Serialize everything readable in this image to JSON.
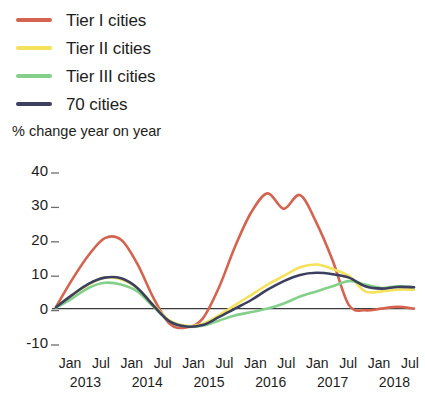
{
  "legend": {
    "items": [
      {
        "label": "Tier I cities",
        "color": "#d4634f",
        "icon": "line-swatch-icon"
      },
      {
        "label": "Tier II cities",
        "color": "#f5e25a",
        "icon": "line-swatch-icon"
      },
      {
        "label": "Tier III cities",
        "color": "#84d08a",
        "icon": "line-swatch-icon"
      },
      {
        "label": "70 cities",
        "color": "#3c3f5e",
        "icon": "line-swatch-icon"
      }
    ]
  },
  "axis_title": "% change year on year",
  "chart_data": {
    "type": "line",
    "title": "",
    "subtitle": "",
    "xlabel": "",
    "ylabel": "% change year on year",
    "ylim": [
      -10,
      40
    ],
    "yticks": [
      40,
      30,
      20,
      10,
      0,
      -10
    ],
    "ytick_labels": [
      "40",
      "30",
      "20",
      "10",
      "0",
      "-10"
    ],
    "grid": false,
    "zero_line": true,
    "legend_position": "top-left",
    "x_tick_labels": [
      "Jan",
      "Jul",
      "Jan",
      "Jul",
      "Jan",
      "Jul",
      "Jan",
      "Jul",
      "Jan",
      "Jul",
      "Jan",
      "Jul"
    ],
    "x_year_labels": [
      "2013",
      "2014",
      "2015",
      "2016",
      "2017",
      "2018"
    ],
    "x": [
      "2013-01",
      "2013-04",
      "2013-07",
      "2013-10",
      "2014-01",
      "2014-04",
      "2014-07",
      "2014-10",
      "2015-01",
      "2015-04",
      "2015-07",
      "2015-10",
      "2016-01",
      "2016-04",
      "2016-07",
      "2016-10",
      "2017-01",
      "2017-04",
      "2017-07",
      "2017-10",
      "2018-01",
      "2018-04",
      "2018-07"
    ],
    "series": [
      {
        "name": "Tier I cities",
        "color": "#d4634f",
        "values": [
          0.5,
          8.5,
          15.5,
          20.5,
          20.0,
          13.0,
          3.0,
          -4.5,
          -5.5,
          -3.0,
          6.0,
          18.0,
          28.0,
          33.5,
          29.0,
          33.0,
          25.0,
          14.0,
          1.0,
          -0.5,
          0.0,
          0.5,
          0.0
        ]
      },
      {
        "name": "Tier II cities",
        "color": "#f5e25a",
        "values": [
          0.3,
          4.0,
          7.0,
          9.0,
          8.5,
          6.0,
          1.0,
          -3.5,
          -5.0,
          -4.5,
          -2.0,
          1.0,
          4.0,
          7.0,
          9.5,
          12.0,
          12.8,
          11.5,
          9.5,
          5.0,
          5.0,
          5.5,
          5.5
        ]
      },
      {
        "name": "Tier III cities",
        "color": "#84d08a",
        "values": [
          0.2,
          3.0,
          6.0,
          7.5,
          7.0,
          5.0,
          0.5,
          -3.8,
          -5.2,
          -5.0,
          -3.5,
          -2.0,
          -1.0,
          0.0,
          1.5,
          3.5,
          5.0,
          6.5,
          8.0,
          7.0,
          6.0,
          6.5,
          6.2
        ]
      },
      {
        "name": "70 cities",
        "color": "#3c3f5e",
        "values": [
          0.4,
          4.0,
          7.2,
          9.0,
          8.8,
          6.0,
          0.8,
          -3.8,
          -5.2,
          -4.8,
          -2.5,
          0.0,
          2.5,
          5.5,
          8.0,
          9.8,
          10.4,
          10.0,
          9.0,
          6.5,
          5.8,
          6.3,
          6.2
        ]
      }
    ]
  }
}
